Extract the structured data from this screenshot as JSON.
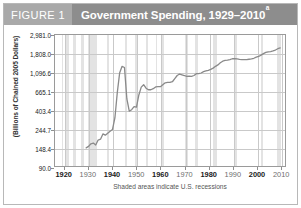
{
  "figure": {
    "label": "FIGURE 1",
    "title": "Government Spending, 1929–2010",
    "title_superscript": "a",
    "header_bg": "#8d8d8d",
    "label_bg": "#a9a9a9",
    "line_color": "#8a8a8a",
    "recession_color": "#e3e3e3",
    "grid_color": "#c9c9c9"
  },
  "chart_data": {
    "type": "line",
    "title": "Government Spending, 1929–2010",
    "xlabel": "",
    "ylabel": "(Billions of Chained 2005 Dollars)",
    "caption": "Shaded areas indicate U.S. recessions",
    "yscale": "log",
    "ylim": [
      90.0,
      2981.0
    ],
    "xlim": [
      1916,
      2012
    ],
    "grid": true,
    "legend": false,
    "ytick_labels": [
      "2,981.0",
      "1,808.0",
      "1,096.6",
      "665.1",
      "403.4",
      "244.7",
      "148.4",
      "90.0"
    ],
    "ytick_values": [
      2981.0,
      1808.0,
      1096.6,
      665.1,
      403.4,
      244.7,
      148.4,
      90.0
    ],
    "xtick_labels": [
      "1920",
      "1930",
      "1940",
      "1950",
      "1960",
      "1970",
      "1980",
      "1990",
      "2000",
      "2010"
    ],
    "xtick_values": [
      1920,
      1930,
      1940,
      1950,
      1960,
      1970,
      1980,
      1990,
      2000,
      2010
    ],
    "xtick_bold": [
      true,
      false,
      true,
      false,
      true,
      false,
      true,
      false,
      true,
      false
    ],
    "series": [
      {
        "name": "Government Spending",
        "x": [
          1929,
          1930,
          1931,
          1932,
          1933,
          1934,
          1935,
          1936,
          1937,
          1938,
          1939,
          1940,
          1941,
          1942,
          1943,
          1944,
          1945,
          1946,
          1947,
          1948,
          1949,
          1950,
          1951,
          1952,
          1953,
          1954,
          1955,
          1956,
          1957,
          1958,
          1959,
          1960,
          1961,
          1962,
          1963,
          1964,
          1965,
          1966,
          1967,
          1968,
          1969,
          1970,
          1971,
          1972,
          1973,
          1974,
          1975,
          1976,
          1977,
          1978,
          1979,
          1980,
          1981,
          1982,
          1983,
          1984,
          1985,
          1986,
          1987,
          1988,
          1989,
          1990,
          1991,
          1992,
          1993,
          1994,
          1995,
          1996,
          1997,
          1998,
          1999,
          2000,
          2001,
          2002,
          2003,
          2004,
          2005,
          2006,
          2007,
          2008,
          2009,
          2010
        ],
        "values": [
          146,
          152,
          163,
          166,
          158,
          180,
          184,
          212,
          205,
          216,
          228,
          239,
          325,
          640,
          1090,
          1290,
          1250,
          540,
          390,
          405,
          440,
          435,
          600,
          740,
          790,
          720,
          690,
          690,
          710,
          745,
          750,
          750,
          790,
          830,
          840,
          840,
          855,
          930,
          1010,
          1050,
          1030,
          1010,
          985,
          990,
          985,
          1010,
          1060,
          1060,
          1080,
          1120,
          1140,
          1160,
          1190,
          1230,
          1290,
          1340,
          1420,
          1480,
          1510,
          1520,
          1545,
          1580,
          1585,
          1575,
          1555,
          1545,
          1545,
          1545,
          1560,
          1575,
          1600,
          1650,
          1680,
          1740,
          1810,
          1870,
          1900,
          1915,
          1945,
          1995,
          2065,
          2110
        ]
      }
    ],
    "recessions": [
      {
        "start": 1918.7,
        "end": 1919.2
      },
      {
        "start": 1920.1,
        "end": 1921.6
      },
      {
        "start": 1923.4,
        "end": 1924.6
      },
      {
        "start": 1926.8,
        "end": 1927.9
      },
      {
        "start": 1929.6,
        "end": 1933.2
      },
      {
        "start": 1937.4,
        "end": 1938.5
      },
      {
        "start": 1945.1,
        "end": 1945.8
      },
      {
        "start": 1948.9,
        "end": 1949.8
      },
      {
        "start": 1953.5,
        "end": 1954.4
      },
      {
        "start": 1957.6,
        "end": 1958.3
      },
      {
        "start": 1960.3,
        "end": 1961.1
      },
      {
        "start": 1969.9,
        "end": 1970.9
      },
      {
        "start": 1973.9,
        "end": 1975.2
      },
      {
        "start": 1980.1,
        "end": 1980.6
      },
      {
        "start": 1981.5,
        "end": 1982.9
      },
      {
        "start": 1990.6,
        "end": 1991.2
      },
      {
        "start": 2001.2,
        "end": 2001.9
      },
      {
        "start": 2007.9,
        "end": 2009.5
      }
    ]
  }
}
